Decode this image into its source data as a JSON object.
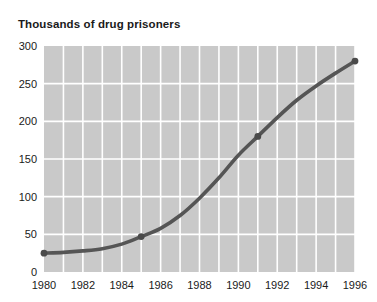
{
  "chart_data": {
    "type": "line",
    "title": "Thousands of drug prisoners",
    "subtitle": "",
    "xlabel": "",
    "ylabel": "",
    "xlim": [
      1980,
      1996
    ],
    "ylim": [
      0,
      300
    ],
    "grid": true,
    "legend": false,
    "legend_position": "none",
    "y_ticks": [
      0,
      50,
      100,
      150,
      200,
      250,
      300
    ],
    "y_tick_labels": [
      "0",
      "50",
      "100",
      "150",
      "200",
      "250",
      "300"
    ],
    "x_ticks": [
      1980,
      1982,
      1984,
      1986,
      1988,
      1990,
      1992,
      1994,
      1996
    ],
    "x_tick_labels": [
      "1980",
      "1982",
      "1984",
      "1986",
      "1988",
      "1990",
      "1992",
      "1994",
      "1996"
    ],
    "x_gridlines": [
      1980,
      1981,
      1982,
      1983,
      1984,
      1985,
      1986,
      1987,
      1988,
      1989,
      1990,
      1991,
      1992,
      1993,
      1994,
      1995,
      1996
    ],
    "x": [
      1980,
      1981,
      1982,
      1983,
      1984,
      1985,
      1986,
      1987,
      1988,
      1989,
      1990,
      1991,
      1992,
      1993,
      1994,
      1995,
      1996
    ],
    "values": [
      25,
      26,
      28,
      31,
      37,
      47,
      58,
      75,
      98,
      125,
      155,
      180,
      205,
      228,
      247,
      264,
      280
    ],
    "markers_at": [
      {
        "x": 1980,
        "y": 25
      },
      {
        "x": 1985,
        "y": 47
      },
      {
        "x": 1991,
        "y": 180
      },
      {
        "x": 1996,
        "y": 280
      }
    ],
    "series": [
      {
        "name": "Drug prisoners",
        "values": [
          25,
          26,
          28,
          31,
          37,
          47,
          58,
          75,
          98,
          125,
          155,
          180,
          205,
          228,
          247,
          264,
          280
        ]
      }
    ],
    "colors": {
      "line": "#555555",
      "marker": "#4a4a4a",
      "plot_background": "#c9c9c9",
      "gridline": "#ffffff",
      "text": "#1a1a1a",
      "page_background": "#ffffff"
    }
  }
}
